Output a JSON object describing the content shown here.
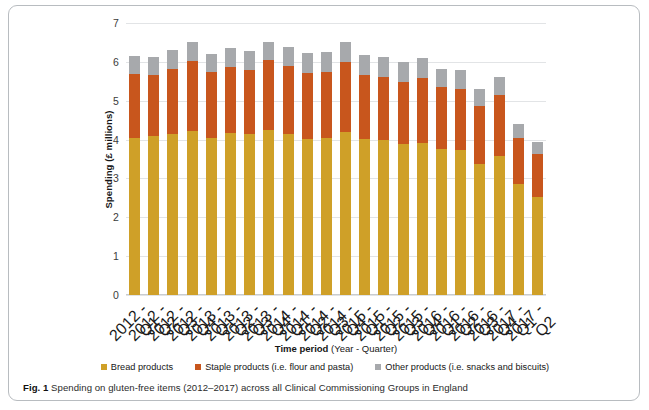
{
  "figure": {
    "caption_label": "Fig. 1",
    "caption_text": "Spending on gluten-free items (2012–2017) across all Clinical Commissioning Groups in England"
  },
  "colors": {
    "bread": "#cfa028",
    "staple": "#c8561d",
    "other": "#a7a9ac",
    "gridline": "#e2e4e6",
    "frame": "#b8bcc0"
  },
  "chart_data": {
    "type": "bar",
    "subtype": "stacked-column",
    "title": "",
    "xlabel_bold": "Time period",
    "xlabel_rest": " (Year - Quarter)",
    "xlabel": "Time period (Year - Quarter)",
    "ylabel_bold": "Spending",
    "ylabel_rest": " (£ millions)",
    "ylabel": "Spending (£ millions)",
    "ylim": [
      0,
      7
    ],
    "yticks": [
      0,
      1,
      2,
      3,
      4,
      5,
      6,
      7
    ],
    "ytick_labels": [
      "0",
      "1",
      "2",
      "3",
      "4",
      "5",
      "6",
      "7"
    ],
    "grid": true,
    "grid_axis": "y",
    "legend_position": "bottom",
    "categories": [
      "2012 - Q1",
      "2012 - Q2",
      "2012 - Q3",
      "2012 - Q4",
      "2013 - Q1",
      "2013 - Q2",
      "2013 - Q3",
      "2013 - Q4",
      "2014 - Q1",
      "2014 - Q2",
      "2014 - Q3",
      "2014 - Q4",
      "2015 - Q1",
      "2015 - Q2",
      "2015 - Q3",
      "2015 - Q4",
      "2016 - Q1",
      "2016 - Q2",
      "2016 - Q3",
      "2016 - Q4",
      "2017 - Q1",
      "2017 - Q2"
    ],
    "series": [
      {
        "name": "Bread products",
        "color": "#cfa028",
        "values": [
          4.05,
          4.1,
          4.15,
          4.22,
          4.05,
          4.18,
          4.15,
          4.25,
          4.15,
          4.02,
          4.05,
          4.2,
          4.02,
          4.0,
          3.88,
          3.92,
          3.75,
          3.72,
          3.38,
          3.58,
          2.85,
          2.52
        ]
      },
      {
        "name": "Staple products (i.e. flour and pasta)",
        "color": "#c8561d",
        "values": [
          1.63,
          1.55,
          1.66,
          1.8,
          1.69,
          1.7,
          1.64,
          1.8,
          1.74,
          1.7,
          1.68,
          1.8,
          1.63,
          1.6,
          1.6,
          1.67,
          1.6,
          1.57,
          1.48,
          1.58,
          1.18,
          1.12
        ]
      },
      {
        "name": "Other products (i.e. snacks and biscuits)",
        "color": "#a7a9ac",
        "values": [
          0.47,
          0.47,
          0.49,
          0.5,
          0.46,
          0.47,
          0.48,
          0.47,
          0.5,
          0.5,
          0.52,
          0.5,
          0.52,
          0.53,
          0.52,
          0.52,
          0.48,
          0.5,
          0.45,
          0.46,
          0.38,
          0.3
        ]
      }
    ],
    "totals": [
      6.15,
      6.12,
      6.3,
      6.52,
      6.2,
      6.35,
      6.27,
      6.52,
      6.39,
      6.22,
      6.25,
      6.5,
      6.17,
      6.13,
      6.0,
      6.11,
      5.83,
      5.79,
      5.31,
      5.62,
      4.41,
      3.94
    ]
  },
  "legend": {
    "items": [
      {
        "label": "Bread products",
        "color": "#cfa028"
      },
      {
        "label": "Staple products (i.e. flour and pasta)",
        "color": "#c8561d"
      },
      {
        "label": "Other products (i.e. snacks and biscuits)",
        "color": "#a7a9ac"
      }
    ]
  }
}
